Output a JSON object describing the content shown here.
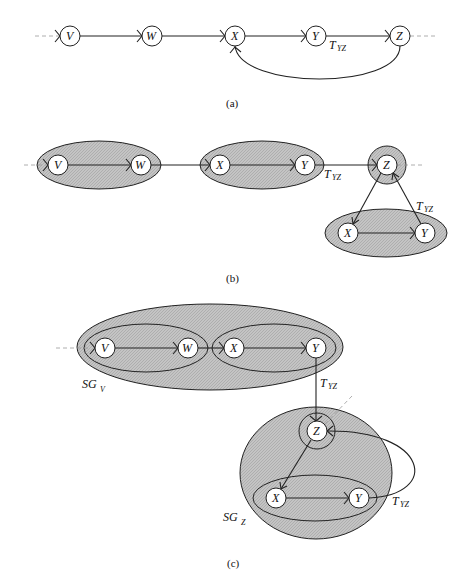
{
  "figure": {
    "panels": [
      {
        "caption": "(a)",
        "nodes": [
          "V",
          "W",
          "X",
          "Y",
          "Z"
        ],
        "edges": [
          [
            "V",
            "W"
          ],
          [
            "W",
            "X"
          ],
          [
            "X",
            "Y"
          ],
          [
            "Y",
            "Z"
          ],
          [
            "Z",
            "X"
          ]
        ],
        "edge_label": {
          "main": "T",
          "sub": "YZ"
        }
      },
      {
        "caption": "(b)",
        "groups": [
          [
            "V",
            "W"
          ],
          [
            "X",
            "Y"
          ],
          [
            "Z"
          ],
          [
            "X",
            "Y"
          ]
        ],
        "nodes_top": [
          "V",
          "W",
          "X",
          "Y",
          "Z"
        ],
        "nodes_bottom": [
          "X",
          "Y"
        ],
        "edge_labels": [
          {
            "main": "T",
            "sub": "YZ"
          },
          {
            "main": "T",
            "sub": "YZ"
          }
        ]
      },
      {
        "caption": "(c)",
        "supergroups": [
          {
            "main": "SG",
            "sub": "V",
            "members": [
              "V",
              "W",
              "X",
              "Y"
            ]
          },
          {
            "main": "SG",
            "sub": "Z",
            "members": [
              "Z",
              "X",
              "Y"
            ]
          }
        ],
        "nodes_top": [
          "V",
          "W",
          "X",
          "Y"
        ],
        "nodes_bottom": [
          "Z",
          "X",
          "Y"
        ],
        "edge_labels": [
          {
            "main": "T",
            "sub": "YZ"
          },
          {
            "main": "T",
            "sub": "YZ"
          }
        ]
      }
    ]
  },
  "labels": {
    "V": "V",
    "W": "W",
    "X": "X",
    "Y": "Y",
    "Z": "Z",
    "T": "T",
    "YZ": "YZ",
    "SG": "SG",
    "subV": "V",
    "subZ": "Z",
    "cap_a": "(a)",
    "cap_b": "(b)",
    "cap_c": "(c)"
  }
}
